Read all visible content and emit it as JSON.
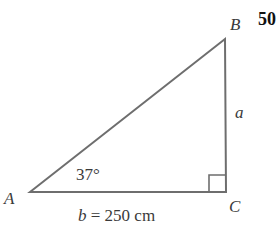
{
  "problem_number": "50",
  "diagram": {
    "type": "right-triangle",
    "vertices": {
      "A": "A",
      "B": "B",
      "C": "C"
    },
    "right_angle_at": "C",
    "angle_label": "37°",
    "side_a_label": "a",
    "side_b_label": "b = 250 cm",
    "line_color": "#6e6e6e"
  }
}
